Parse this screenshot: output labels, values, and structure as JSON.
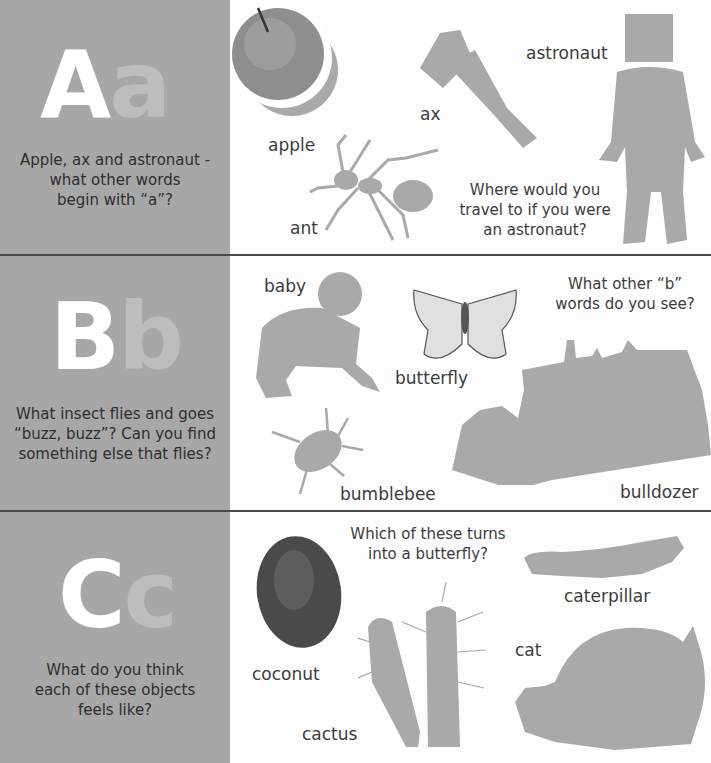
{
  "sections": [
    {
      "letter_upper": "A",
      "letter_lower": "a",
      "prompt_lines": [
        "Apple, ax and astronaut -",
        "what other words",
        "begin with “a”?"
      ],
      "labels": {
        "apple": "apple",
        "ax": "ax",
        "astronaut": "astronaut",
        "ant": "ant"
      },
      "question_lines": [
        "Where would you",
        "travel to if you were",
        "an astronaut?"
      ]
    },
    {
      "letter_upper": "B",
      "letter_lower": "b",
      "prompt_lines": [
        "What insect flies and goes",
        "“buzz, buzz”? Can you find",
        "something else that flies?"
      ],
      "labels": {
        "baby": "baby",
        "butterfly": "butterfly",
        "bumblebee": "bumblebee",
        "bulldozer": "bulldozer"
      },
      "question_lines": [
        "What other “b”",
        "words do you see?"
      ]
    },
    {
      "letter_upper": "C",
      "letter_lower": "c",
      "prompt_lines": [
        "What do you think",
        "each of these objects",
        "feels like?"
      ],
      "labels": {
        "coconut": "coconut",
        "cactus": "cactus",
        "caterpillar": "caterpillar",
        "cat": "cat"
      },
      "question_lines": [
        "Which of these turns",
        "into a butterfly?"
      ]
    }
  ],
  "colors": {
    "panel": "#a7a7a7",
    "silhouette": "#a9a9a9",
    "divider": "#4a4a4a",
    "text": "#3a3a3a"
  }
}
